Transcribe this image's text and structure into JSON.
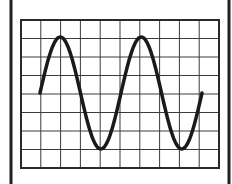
{
  "diagram": {
    "type": "oscilloscope-display",
    "grid": {
      "columns": 10,
      "rows": 8
    },
    "waveform": {
      "shape": "sine",
      "cycles": 2,
      "start_phase": "zero-crossing-rising"
    },
    "colors": {
      "frame": "#222222",
      "grid": "#3a3a3a",
      "trace": "#1a1a1a",
      "background": "#ffffff"
    }
  }
}
